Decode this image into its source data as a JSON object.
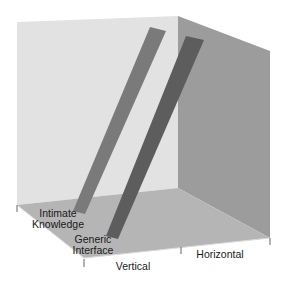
{
  "diagram": {
    "type": "3d-box-plot",
    "colors": {
      "background": "#ffffff",
      "left_wall": "#e2e2e2",
      "right_wall": "#9c9c9c",
      "floor": "#b5b5b5",
      "bar_intimate": "#7a7a7a",
      "bar_generic": "#5d5d5d",
      "tick": "#555555",
      "text": "#1a1a1a"
    },
    "bars": [
      {
        "name": "Intimate Knowledge",
        "line1": "Intimate",
        "line2": "Knowledge"
      },
      {
        "name": "Generic Interface",
        "line1": "Generic",
        "line2": "Interface"
      }
    ],
    "axes": {
      "vertical_label": "Vertical",
      "horizontal_label": "Horizontal"
    }
  }
}
